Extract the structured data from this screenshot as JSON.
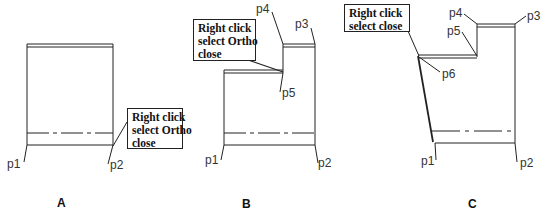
{
  "figures": [
    {
      "id": "A",
      "caption": "A",
      "callout": [
        "Right click",
        "select Ortho",
        "close"
      ],
      "points": [
        "p1",
        "p2"
      ]
    },
    {
      "id": "B",
      "caption": "B",
      "callout": [
        "Right click",
        "select Ortho",
        "close"
      ],
      "points": [
        "p1",
        "p2",
        "p3",
        "p4",
        "p5"
      ]
    },
    {
      "id": "C",
      "caption": "C",
      "callout": [
        "Right click",
        "select close"
      ],
      "points": [
        "p1",
        "p2",
        "p3",
        "p4",
        "p5",
        "p6"
      ]
    }
  ],
  "colors": {
    "line": "#222222",
    "background": "#ffffff"
  }
}
